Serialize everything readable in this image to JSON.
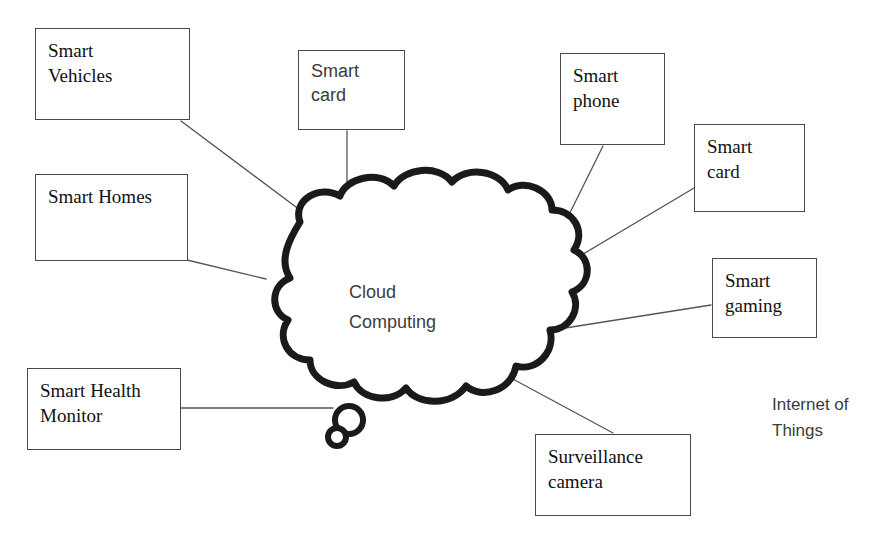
{
  "diagram": {
    "title": "Internet of Things",
    "center_label": "Cloud\nComputing",
    "caption": "Internet of\nThings",
    "colors": {
      "background": "#ffffff",
      "cloud_stroke": "#1a1a1a",
      "box_border": "#4a4a4a",
      "connector": "#555555",
      "text": "#111111",
      "muted_text": "#3d3d3d"
    },
    "center": {
      "name": "cloud-computing",
      "shape": "thought-cloud",
      "label": "Cloud\nComputing",
      "stroke_width": 7
    },
    "nodes": [
      {
        "id": "smart-vehicles",
        "label": "Smart\nVehicles",
        "font": "serif",
        "x": 35,
        "y": 28,
        "width": 155,
        "height": 92
      },
      {
        "id": "smart-card-top",
        "label": "Smart\ncard",
        "font": "sans",
        "x": 298,
        "y": 50,
        "width": 107,
        "height": 80
      },
      {
        "id": "smart-phone",
        "label": "Smart\nphone",
        "font": "serif",
        "x": 560,
        "y": 53,
        "width": 105,
        "height": 92
      },
      {
        "id": "smart-card-right",
        "label": "Smart\ncard",
        "font": "serif",
        "x": 694,
        "y": 124,
        "width": 111,
        "height": 88
      },
      {
        "id": "smart-homes",
        "label": "Smart Homes",
        "font": "serif",
        "x": 35,
        "y": 174,
        "width": 153,
        "height": 87
      },
      {
        "id": "smart-gaming",
        "label": "Smart\ngaming",
        "font": "serif",
        "x": 712,
        "y": 258,
        "width": 105,
        "height": 80
      },
      {
        "id": "smart-health-monitor",
        "label": "Smart Health\nMonitor",
        "font": "serif",
        "x": 27,
        "y": 368,
        "width": 154,
        "height": 82
      },
      {
        "id": "surveillance-camera",
        "label": "Surveillance\ncamera",
        "font": "serif",
        "x": 535,
        "y": 434,
        "width": 156,
        "height": 82
      }
    ],
    "connectors": [
      {
        "id": "connector-smart-vehicles",
        "from": "smart-vehicles",
        "x1": 181,
        "y1": 121,
        "x2": 312,
        "y2": 219
      },
      {
        "id": "connector-smart-card-top",
        "from": "smart-card-top",
        "x1": 347,
        "y1": 131,
        "x2": 347,
        "y2": 218
      },
      {
        "id": "connector-smart-phone",
        "from": "smart-phone",
        "x1": 603,
        "y1": 146,
        "x2": 552,
        "y2": 249
      },
      {
        "id": "connector-smart-card-right",
        "from": "smart-card-right",
        "x1": 694,
        "y1": 188,
        "x2": 553,
        "y2": 272
      },
      {
        "id": "connector-smart-homes",
        "from": "smart-homes",
        "x1": 187,
        "y1": 260,
        "x2": 266,
        "y2": 279
      },
      {
        "id": "connector-smart-gaming",
        "from": "smart-gaming",
        "x1": 711,
        "y1": 305,
        "x2": 559,
        "y2": 329
      },
      {
        "id": "connector-smart-health-monitor",
        "from": "smart-health-monitor",
        "x1": 181,
        "y1": 408,
        "x2": 333,
        "y2": 408
      },
      {
        "id": "connector-surveillance-camera",
        "from": "surveillance-camera",
        "x1": 511,
        "y1": 378,
        "x2": 613,
        "y2": 433
      }
    ],
    "caption_label": {
      "id": "internet-of-things-caption",
      "text": "Internet of\nThings",
      "x": 772,
      "y": 392
    }
  }
}
